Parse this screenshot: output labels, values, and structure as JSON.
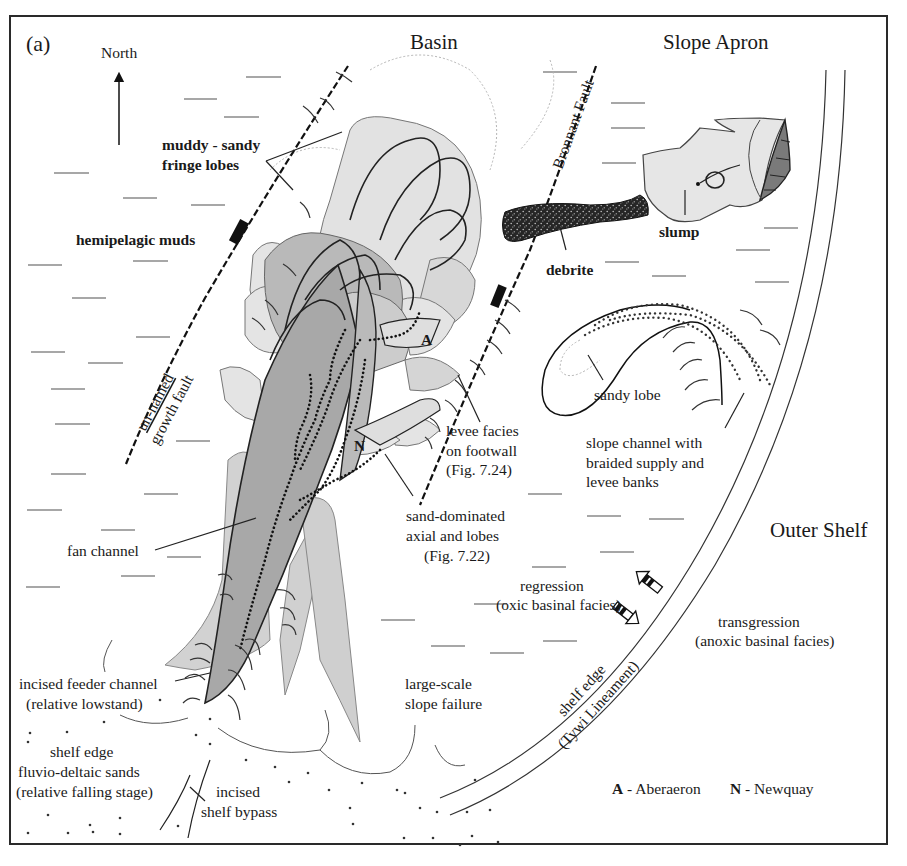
{
  "figure": {
    "panel_label": "(a)",
    "north_label": "North",
    "regions": {
      "basin": "Basin",
      "slope_apron": "Slope Apron",
      "outer_shelf": "Outer Shelf"
    },
    "faults": {
      "bronnant": "Bronnant Fault",
      "unnamed_line1": "un-named",
      "unnamed_line2": "growth fault"
    },
    "labels": {
      "fringe_lobes_1": "muddy - sandy",
      "fringe_lobes_2": "fringe lobes",
      "hemipelagic": "hemipelagic muds",
      "debrite": "debrite",
      "slump": "slump",
      "sandy_lobe": "sandy lobe",
      "slope_channel_1": "slope channel with",
      "slope_channel_2": "braided supply and",
      "slope_channel_3": "levee banks",
      "levee_1": "levee facies",
      "levee_2": "on footwall",
      "levee_3": "(Fig. 7.24)",
      "sand_dom_1": "sand-dominated",
      "sand_dom_2": "axial and lobes",
      "sand_dom_3": "(Fig. 7.22)",
      "fan_channel": "fan channel",
      "regression_1": "regression",
      "regression_2": "(oxic basinal facies)",
      "transgression_1": "transgression",
      "transgression_2": "(anoxic basinal facies)",
      "feeder_1": "incised feeder channel",
      "feeder_2": "(relative lowstand)",
      "slope_failure_1": "large-scale",
      "slope_failure_2": "slope failure",
      "shelf_edge_sands_1": "shelf edge",
      "shelf_edge_sands_2": "fluvio-deltaic sands",
      "shelf_edge_sands_3": "(relative falling stage)",
      "bypass_1": "incised",
      "bypass_2": "shelf bypass",
      "shelf_edge_1": "shelf edge",
      "shelf_edge_2": "(Tywi Lineament)",
      "marker_a": "A",
      "marker_n": "N"
    },
    "legend": {
      "a_key": "A",
      "a_text": " - Aberaeron",
      "n_key": "N",
      "n_text": " - Newquay"
    },
    "colors": {
      "frame": "#2a2a2a",
      "fan_light": "#e4e4e4",
      "fan_mid": "#c9c9c9",
      "fan_dark": "#a9a9a9",
      "debrite": "#2b2b2b",
      "slump": "#e6e6e6",
      "scarp": "#7a7a7a"
    }
  }
}
